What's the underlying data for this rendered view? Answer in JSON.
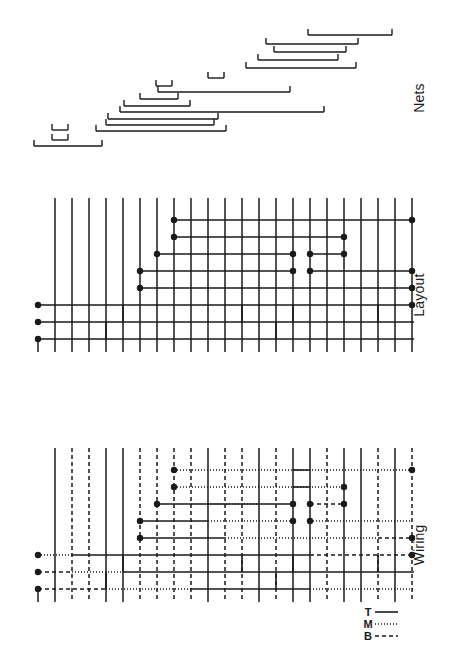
{
  "figure": {
    "background_color": "#ffffff",
    "ink_color": "#1a1a1a",
    "orientation_note": "Panels stacked vertically; panel labels rotated 90 degrees along the right edge",
    "panels": [
      {
        "id": "nets",
        "label": "Nets",
        "label_x": 424,
        "label_y": 98
      },
      {
        "id": "layout",
        "label": "Layout",
        "label_x": 424,
        "label_y": 295
      },
      {
        "id": "wiring",
        "label": "Wiring",
        "label_x": 424,
        "label_y": 545
      }
    ]
  },
  "legend": {
    "x": 368,
    "y": 612,
    "entries": [
      {
        "key": "T",
        "label": "T",
        "style": "solid",
        "dash": "none",
        "description": "top layer"
      },
      {
        "key": "M",
        "label": "M",
        "style": "dotted",
        "dash": "1,2",
        "description": "middle layer"
      },
      {
        "key": "B",
        "label": "B",
        "style": "dashed",
        "dash": "4,3",
        "description": "bottom layer"
      }
    ]
  },
  "chart_data": {
    "type": "diagram",
    "subtype": "vlsi-channel-routing",
    "grid": {
      "column_spacing": 17.0,
      "first_column_x": 38,
      "column_count": 23,
      "row_spacing": 17.0
    },
    "nets_panel": {
      "label": "Nets",
      "description": "Horizontal net spans with terminal ticks at each end; vertical position encodes net index",
      "y_top": 30,
      "y_bottom": 148,
      "row_spacing": 8.5,
      "tick_length": 6,
      "nets": [
        {
          "id": 1,
          "x1": 308,
          "x2": 392,
          "y": 35
        },
        {
          "id": 2,
          "x1": 266,
          "x2": 358,
          "y": 44
        },
        {
          "id": 3,
          "x1": 274,
          "x2": 346,
          "y": 52
        },
        {
          "id": 4,
          "x1": 258,
          "x2": 338,
          "y": 60
        },
        {
          "id": 5,
          "x1": 246,
          "x2": 356,
          "y": 68
        },
        {
          "id": 6,
          "x1": 208,
          "x2": 224,
          "y": 78
        },
        {
          "id": 7,
          "x1": 156,
          "x2": 172,
          "y": 86
        },
        {
          "id": 8,
          "x1": 158,
          "x2": 290,
          "y": 92
        },
        {
          "id": 9,
          "x1": 140,
          "x2": 178,
          "y": 99
        },
        {
          "id": 10,
          "x1": 124,
          "x2": 190,
          "y": 106
        },
        {
          "id": 11,
          "x1": 120,
          "x2": 324,
          "y": 112
        },
        {
          "id": 12,
          "x1": 108,
          "x2": 218,
          "y": 119
        },
        {
          "id": 13,
          "x1": 106,
          "x2": 214,
          "y": 125
        },
        {
          "id": 14,
          "x1": 96,
          "x2": 226,
          "y": 131
        },
        {
          "id": 15,
          "x1": 52,
          "x2": 68,
          "y": 130
        },
        {
          "id": 16,
          "x1": 52,
          "x2": 68,
          "y": 140
        },
        {
          "id": 17,
          "x1": 34,
          "x2": 102,
          "y": 146
        }
      ]
    },
    "layout_panel": {
      "label": "Layout",
      "description": "Grid of vertical terminal pins crossed by horizontal routing tracks with junction dots",
      "x_left": 38,
      "x_right": 414,
      "y_top": 198,
      "y_bottom": 352,
      "pin_dot_radius": 3.2,
      "columns_x": [
        38,
        55,
        72,
        89,
        106,
        123,
        140,
        157,
        174,
        191,
        208,
        225,
        242,
        259,
        276,
        293,
        310,
        327,
        344,
        361,
        378,
        395,
        412
      ],
      "vertical_segments": [
        {
          "x": 38,
          "y1": 338,
          "y2": 352
        },
        {
          "x": 55,
          "y1": 198,
          "y2": 352
        },
        {
          "x": 72,
          "y1": 198,
          "y2": 352
        },
        {
          "x": 89,
          "y1": 198,
          "y2": 352
        },
        {
          "x": 106,
          "y1": 198,
          "y2": 352
        },
        {
          "x": 123,
          "y1": 198,
          "y2": 352
        },
        {
          "x": 140,
          "y1": 198,
          "y2": 352
        },
        {
          "x": 157,
          "y1": 198,
          "y2": 352
        },
        {
          "x": 174,
          "y1": 198,
          "y2": 352
        },
        {
          "x": 191,
          "y1": 198,
          "y2": 352
        },
        {
          "x": 208,
          "y1": 198,
          "y2": 352
        },
        {
          "x": 225,
          "y1": 198,
          "y2": 352
        },
        {
          "x": 242,
          "y1": 198,
          "y2": 352
        },
        {
          "x": 259,
          "y1": 198,
          "y2": 352
        },
        {
          "x": 276,
          "y1": 198,
          "y2": 352
        },
        {
          "x": 293,
          "y1": 198,
          "y2": 352
        },
        {
          "x": 310,
          "y1": 198,
          "y2": 352
        },
        {
          "x": 327,
          "y1": 198,
          "y2": 352
        },
        {
          "x": 344,
          "y1": 198,
          "y2": 352
        },
        {
          "x": 361,
          "y1": 198,
          "y2": 352
        },
        {
          "x": 378,
          "y1": 198,
          "y2": 352
        },
        {
          "x": 395,
          "y1": 198,
          "y2": 352
        },
        {
          "x": 412,
          "y1": 198,
          "y2": 352
        }
      ],
      "tracks": [
        {
          "id": "t1",
          "y": 220,
          "x1": 174,
          "x2": 412,
          "dots": [
            174,
            412
          ]
        },
        {
          "id": "t2",
          "y": 237,
          "x1": 174,
          "x2": 344,
          "dots": [
            174,
            344
          ]
        },
        {
          "id": "t3",
          "y": 254,
          "x1": 157,
          "x2": 293,
          "dots": [
            157,
            293
          ]
        },
        {
          "id": "t4",
          "y": 254,
          "x1": 310,
          "x2": 344,
          "dots": [
            310,
            344
          ]
        },
        {
          "id": "t5",
          "y": 271,
          "x1": 140,
          "x2": 293,
          "dots": [
            140,
            293
          ]
        },
        {
          "id": "t6",
          "y": 271,
          "x1": 310,
          "x2": 412,
          "dots": [
            310,
            412
          ]
        },
        {
          "id": "t7",
          "y": 288,
          "x1": 140,
          "x2": 412,
          "dots": [
            140,
            412
          ]
        },
        {
          "id": "t8",
          "y": 305,
          "x1": 38,
          "x2": 412,
          "dots": [
            38,
            412
          ]
        },
        {
          "id": "t9",
          "y": 322,
          "x1": 38,
          "x2": 414,
          "dots": [
            38
          ]
        },
        {
          "id": "t10",
          "y": 339,
          "x1": 38,
          "x2": 414,
          "dots": [
            38
          ]
        }
      ],
      "jogs": [
        {
          "from_track": "t8",
          "x": 123,
          "y1": 305,
          "y2": 322
        },
        {
          "from_track": "t9",
          "x": 106,
          "y1": 322,
          "y2": 339
        },
        {
          "from_track": "t8",
          "x": 242,
          "y1": 305,
          "y2": 322
        },
        {
          "from_track": "t9",
          "x": 276,
          "y1": 322,
          "y2": 339
        },
        {
          "from_track": "t8",
          "x": 293,
          "y1": 305,
          "y2": 322
        },
        {
          "from_track": "t8",
          "x": 378,
          "y1": 305,
          "y2": 322
        }
      ]
    },
    "wiring_panel": {
      "label": "Wiring",
      "description": "Same routing topology as Layout, with every segment assigned to a layer: T solid, M dotted, B dashed",
      "x_left": 38,
      "x_right": 414,
      "y_top": 448,
      "y_bottom": 602,
      "pin_dot_radius": 3.2,
      "layer_styles": {
        "T": "none",
        "M": "1,2",
        "B": "4,3"
      },
      "vertical_segments": [
        {
          "x": 38,
          "y1": 588,
          "y2": 602,
          "layer": "T"
        },
        {
          "x": 55,
          "y1": 448,
          "y2": 602,
          "layer": "T"
        },
        {
          "x": 72,
          "y1": 448,
          "y2": 602,
          "layer": "B"
        },
        {
          "x": 89,
          "y1": 448,
          "y2": 602,
          "layer": "B"
        },
        {
          "x": 106,
          "y1": 448,
          "y2": 602,
          "layer": "T"
        },
        {
          "x": 123,
          "y1": 448,
          "y2": 602,
          "layer": "T"
        },
        {
          "x": 140,
          "y1": 448,
          "y2": 602,
          "layer": "B"
        },
        {
          "x": 157,
          "y1": 448,
          "y2": 602,
          "layer": "B"
        },
        {
          "x": 174,
          "y1": 448,
          "y2": 602,
          "layer": "B"
        },
        {
          "x": 191,
          "y1": 448,
          "y2": 602,
          "layer": "B"
        },
        {
          "x": 208,
          "y1": 448,
          "y2": 602,
          "layer": "T"
        },
        {
          "x": 225,
          "y1": 448,
          "y2": 602,
          "layer": "B"
        },
        {
          "x": 242,
          "y1": 448,
          "y2": 602,
          "layer": "B"
        },
        {
          "x": 259,
          "y1": 448,
          "y2": 602,
          "layer": "T"
        },
        {
          "x": 276,
          "y1": 448,
          "y2": 602,
          "layer": "B"
        },
        {
          "x": 293,
          "y1": 448,
          "y2": 602,
          "layer": "T"
        },
        {
          "x": 310,
          "y1": 448,
          "y2": 602,
          "layer": "T"
        },
        {
          "x": 327,
          "y1": 448,
          "y2": 602,
          "layer": "B"
        },
        {
          "x": 344,
          "y1": 448,
          "y2": 602,
          "layer": "T"
        },
        {
          "x": 361,
          "y1": 448,
          "y2": 602,
          "layer": "T"
        },
        {
          "x": 378,
          "y1": 448,
          "y2": 602,
          "layer": "B"
        },
        {
          "x": 395,
          "y1": 448,
          "y2": 602,
          "layer": "T"
        },
        {
          "x": 412,
          "y1": 448,
          "y2": 602,
          "layer": "B"
        }
      ],
      "tracks": [
        {
          "id": "w1",
          "y": 470,
          "x1": 174,
          "x2": 412,
          "layer": "M",
          "dots": [
            174,
            412
          ]
        },
        {
          "id": "w1b",
          "y": 470,
          "x1": 293,
          "x2": 310,
          "layer": "T",
          "dots": []
        },
        {
          "id": "w2",
          "y": 487,
          "x1": 174,
          "x2": 344,
          "layer": "M",
          "dots": [
            174,
            344
          ]
        },
        {
          "id": "w2b",
          "y": 487,
          "x1": 293,
          "x2": 310,
          "layer": "T",
          "dots": []
        },
        {
          "id": "w3",
          "y": 504,
          "x1": 157,
          "x2": 293,
          "layer": "T",
          "dots": [
            157,
            293
          ]
        },
        {
          "id": "w3b",
          "y": 504,
          "x1": 208,
          "x2": 259,
          "layer": "M",
          "dots": []
        },
        {
          "id": "w4",
          "y": 504,
          "x1": 310,
          "x2": 344,
          "layer": "B",
          "dots": [
            310,
            344
          ]
        },
        {
          "id": "w5",
          "y": 521,
          "x1": 140,
          "x2": 208,
          "layer": "T",
          "dots": [
            140,
            293
          ]
        },
        {
          "id": "w5b",
          "y": 521,
          "x1": 208,
          "x2": 293,
          "layer": "M",
          "dots": []
        },
        {
          "id": "w6",
          "y": 521,
          "x1": 310,
          "x2": 412,
          "layer": "M",
          "dots": [
            310
          ]
        },
        {
          "id": "w7",
          "y": 538,
          "x1": 140,
          "x2": 225,
          "layer": "T",
          "dots": [
            140,
            412
          ]
        },
        {
          "id": "w7b",
          "y": 538,
          "x1": 225,
          "x2": 378,
          "layer": "M",
          "dots": []
        },
        {
          "id": "w7c",
          "y": 538,
          "x1": 378,
          "x2": 412,
          "layer": "B",
          "dots": []
        },
        {
          "id": "w8",
          "y": 555,
          "x1": 38,
          "x2": 72,
          "layer": "M",
          "dots": [
            38,
            412
          ]
        },
        {
          "id": "w8b",
          "y": 555,
          "x1": 72,
          "x2": 123,
          "layer": "T",
          "dots": []
        },
        {
          "id": "w8c",
          "y": 555,
          "x1": 123,
          "x2": 310,
          "layer": "T",
          "dots": []
        },
        {
          "id": "w8d",
          "y": 555,
          "x1": 310,
          "x2": 412,
          "layer": "B",
          "dots": []
        },
        {
          "id": "w9",
          "y": 572,
          "x1": 38,
          "x2": 72,
          "layer": "B",
          "dots": [
            38
          ]
        },
        {
          "id": "w9b",
          "y": 572,
          "x1": 72,
          "x2": 123,
          "layer": "M",
          "dots": []
        },
        {
          "id": "w9c",
          "y": 572,
          "x1": 123,
          "x2": 414,
          "layer": "T",
          "dots": []
        },
        {
          "id": "w10",
          "y": 589,
          "x1": 38,
          "x2": 106,
          "layer": "B",
          "dots": [
            38
          ]
        },
        {
          "id": "w10b",
          "y": 589,
          "x1": 106,
          "x2": 191,
          "layer": "M",
          "dots": []
        },
        {
          "id": "w10c",
          "y": 589,
          "x1": 191,
          "x2": 310,
          "layer": "T",
          "dots": []
        },
        {
          "id": "w10d",
          "y": 589,
          "x1": 310,
          "x2": 414,
          "layer": "M",
          "dots": []
        }
      ],
      "jogs": [
        {
          "x": 123,
          "y1": 555,
          "y2": 572,
          "layer": "T"
        },
        {
          "x": 106,
          "y1": 572,
          "y2": 589,
          "layer": "T"
        },
        {
          "x": 242,
          "y1": 555,
          "y2": 572,
          "layer": "T"
        },
        {
          "x": 276,
          "y1": 572,
          "y2": 589,
          "layer": "T"
        },
        {
          "x": 293,
          "y1": 555,
          "y2": 572,
          "layer": "T"
        },
        {
          "x": 378,
          "y1": 555,
          "y2": 572,
          "layer": "T"
        }
      ]
    }
  }
}
